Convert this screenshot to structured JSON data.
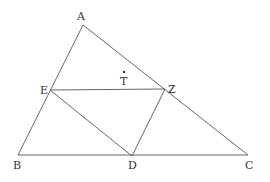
{
  "diagram": {
    "type": "geometry",
    "points": {
      "A": {
        "label": "A",
        "x": 83,
        "y": 25
      },
      "B": {
        "label": "B",
        "x": 18,
        "y": 155
      },
      "C": {
        "label": "C",
        "x": 248,
        "y": 155
      },
      "D": {
        "label": "D",
        "x": 132,
        "y": 156
      },
      "E": {
        "label": "E",
        "x": 50,
        "y": 90
      },
      "Z": {
        "label": "Z",
        "x": 165,
        "y": 89
      },
      "T": {
        "label": "T",
        "x": 124,
        "y": 72
      }
    },
    "segments": [
      [
        "A",
        "B"
      ],
      [
        "A",
        "C"
      ],
      [
        "B",
        "C"
      ],
      [
        "E",
        "Z"
      ],
      [
        "E",
        "D"
      ],
      [
        "Z",
        "D"
      ]
    ],
    "labels": {
      "A": "A",
      "B": "B",
      "C": "C",
      "D": "D",
      "E": "E",
      "Z": "Z",
      "T": "T"
    },
    "colors": {
      "line": "#555555",
      "text": "#333333",
      "background": "#ffffff"
    }
  }
}
